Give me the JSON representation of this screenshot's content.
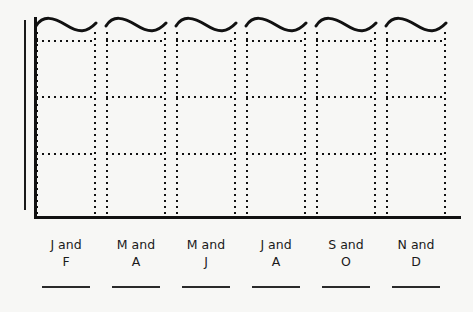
{
  "chart_data": {
    "type": "bar",
    "title": "",
    "subtitle": "",
    "xlabel": "",
    "ylabel": "",
    "categories": [
      "J and F",
      "M and A",
      "M and J",
      "J and A",
      "S and O",
      "N and D"
    ],
    "category_lines": [
      {
        "line1": "J and",
        "line2": "F"
      },
      {
        "line1": "M and",
        "line2": "A"
      },
      {
        "line1": "M and",
        "line2": "J"
      },
      {
        "line1": "J and",
        "line2": "A"
      },
      {
        "line1": "S and",
        "line2": "O"
      },
      {
        "line1": "N and",
        "line2": "D"
      }
    ],
    "values": [
      null,
      null,
      null,
      null,
      null,
      null
    ],
    "tick_labels": [],
    "legend": [],
    "grid": true,
    "gridlines_per_bar": 3,
    "bars_truncated": true,
    "bar_top_style": "wavy-break",
    "bar_outline_style": "dotted",
    "axis_y_style": "double-line",
    "axis_x_style": "solid",
    "colors": {
      "ink": "#111111",
      "background": "#f7f7f5",
      "bar_fill": "#ffffff"
    }
  },
  "axes": {
    "y_axis_name": "y-axis",
    "x_axis_name": "x-axis"
  }
}
